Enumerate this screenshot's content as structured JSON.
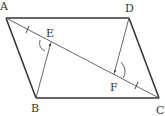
{
  "diagram": {
    "title": "",
    "type": "parallelogram-with-diagonal",
    "points": {
      "A": {
        "label": "A",
        "x": 6,
        "y": 18,
        "lx": 1,
        "ly": 11
      },
      "B": {
        "label": "B",
        "x": 36,
        "y": 98,
        "lx": 31,
        "ly": 112
      },
      "C": {
        "label": "C",
        "x": 159,
        "y": 98,
        "lx": 156,
        "ly": 114
      },
      "D": {
        "label": "D",
        "x": 129,
        "y": 18,
        "lx": 124,
        "ly": 12
      },
      "E": {
        "label": "E",
        "x": 51,
        "y": 42,
        "lx": 45,
        "ly": 37
      },
      "F": {
        "label": "F",
        "x": 114,
        "y": 74,
        "lx": 109,
        "ly": 91
      }
    },
    "segments": [
      {
        "name": "AD",
        "from": "A",
        "to": "D",
        "weight": "thick"
      },
      {
        "name": "AB",
        "from": "A",
        "to": "B",
        "weight": "thick"
      },
      {
        "name": "BC",
        "from": "B",
        "to": "C",
        "weight": "thick"
      },
      {
        "name": "DC",
        "from": "D",
        "to": "C",
        "weight": "thick"
      },
      {
        "name": "AC",
        "from": "A",
        "to": "C",
        "weight": "thin"
      },
      {
        "name": "BE",
        "from": "B",
        "to": "E",
        "weight": "thin"
      },
      {
        "name": "DF",
        "from": "D",
        "to": "F",
        "weight": "thin"
      }
    ],
    "marks": {
      "equal_ticks": [
        "AE",
        "FC"
      ],
      "right_angles": [
        "E",
        "F"
      ]
    },
    "colors": {
      "stroke": "#333333",
      "thin_stroke": "#555555",
      "label": "#333333"
    }
  }
}
